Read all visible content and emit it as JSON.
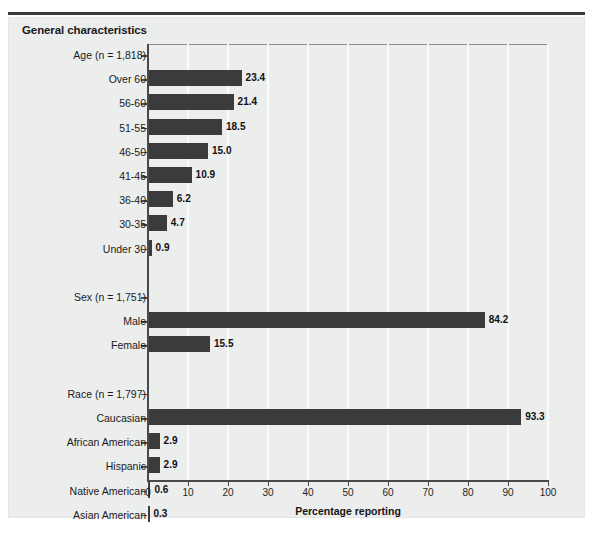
{
  "page_remnant": "",
  "figure": {
    "title": "General characteristics",
    "x_axis_title": "Percentage reporting"
  },
  "chart_data": {
    "type": "bar",
    "orientation": "horizontal",
    "title": "General characteristics",
    "xlabel": "Percentage reporting",
    "ylabel": "",
    "xlim": [
      0,
      100
    ],
    "xticks": [
      0,
      10,
      20,
      30,
      40,
      50,
      60,
      70,
      80,
      90,
      100
    ],
    "grid": "vertical gridlines at every 10 units",
    "legend": "none",
    "bar_color": "#3b3b3b",
    "background_color": "#eceded",
    "groups": [
      {
        "name": "Age",
        "header": "Age (n = 1,818)",
        "n": 1818,
        "categories": [
          "Over 60",
          "56-60",
          "51-55",
          "46-50",
          "41-45",
          "36-40",
          "30-35",
          "Under 30"
        ],
        "values": [
          23.4,
          21.4,
          18.5,
          15.0,
          10.9,
          6.2,
          4.7,
          0.9
        ]
      },
      {
        "name": "Sex",
        "header": "Sex (n = 1,751)",
        "n": 1751,
        "categories": [
          "Male",
          "Female"
        ],
        "values": [
          84.2,
          15.5
        ]
      },
      {
        "name": "Race",
        "header": "Race (n = 1,797)",
        "n": 1797,
        "categories": [
          "Caucasian",
          "African American",
          "Hispanic",
          "Native American",
          "Asian American"
        ],
        "values": [
          93.3,
          2.9,
          2.9,
          0.6,
          0.3
        ]
      }
    ],
    "categories": [
      "Age (n = 1,818)",
      "Over 60",
      "56-60",
      "51-55",
      "46-50",
      "41-45",
      "36-40",
      "30-35",
      "Under 30",
      "Sex (n = 1,751)",
      "Male",
      "Female",
      "Race (n = 1,797)",
      "Caucasian",
      "African American",
      "Hispanic",
      "Native American",
      "Asian American"
    ],
    "values": [
      null,
      23.4,
      21.4,
      18.5,
      15.0,
      10.9,
      6.2,
      4.7,
      0.9,
      null,
      84.2,
      15.5,
      null,
      93.3,
      2.9,
      2.9,
      0.6,
      0.3
    ],
    "value_labels": [
      "",
      "23.4",
      "21.4",
      "18.5",
      "15.0",
      "10.9",
      "6.2",
      "4.7",
      "0.9",
      "",
      "84.2",
      "15.5",
      "",
      "93.3",
      "2.9",
      "2.9",
      "0.6",
      "0.3"
    ]
  },
  "axis": {
    "ticks": [
      "0",
      "10",
      "20",
      "30",
      "40",
      "50",
      "60",
      "70",
      "80",
      "90",
      "100"
    ]
  },
  "rows": [
    {
      "label": "Age (n = 1,818)",
      "value": null,
      "value_label": "",
      "group": true
    },
    {
      "label": "Over 60",
      "value": 23.4,
      "value_label": "23.4",
      "group": false
    },
    {
      "label": "56-60",
      "value": 21.4,
      "value_label": "21.4",
      "group": false
    },
    {
      "label": "51-55",
      "value": 18.5,
      "value_label": "18.5",
      "group": false
    },
    {
      "label": "46-50",
      "value": 15.0,
      "value_label": "15.0",
      "group": false
    },
    {
      "label": "41-45",
      "value": 10.9,
      "value_label": "10.9",
      "group": false
    },
    {
      "label": "36-40",
      "value": 6.2,
      "value_label": "6.2",
      "group": false
    },
    {
      "label": "30-35",
      "value": 4.7,
      "value_label": "4.7",
      "group": false
    },
    {
      "label": "Under 30",
      "value": 0.9,
      "value_label": "0.9",
      "group": false
    },
    {
      "label": "",
      "value": null,
      "value_label": "",
      "group": false,
      "spacer": true
    },
    {
      "label": "Sex (n = 1,751)",
      "value": null,
      "value_label": "",
      "group": true
    },
    {
      "label": "Male",
      "value": 84.2,
      "value_label": "84.2",
      "group": false
    },
    {
      "label": "Female",
      "value": 15.5,
      "value_label": "15.5",
      "group": false
    },
    {
      "label": "",
      "value": null,
      "value_label": "",
      "group": false,
      "spacer": true
    },
    {
      "label": "Race (n = 1,797)",
      "value": null,
      "value_label": "",
      "group": true
    },
    {
      "label": "Caucasian",
      "value": 93.3,
      "value_label": "93.3",
      "group": false
    },
    {
      "label": "African American",
      "value": 2.9,
      "value_label": "2.9",
      "group": false
    },
    {
      "label": "Hispanic",
      "value": 2.9,
      "value_label": "2.9",
      "group": false
    },
    {
      "label": "Native American",
      "value": 0.6,
      "value_label": "0.6",
      "group": false
    },
    {
      "label": "Asian American",
      "value": 0.3,
      "value_label": "0.3",
      "group": false
    }
  ]
}
